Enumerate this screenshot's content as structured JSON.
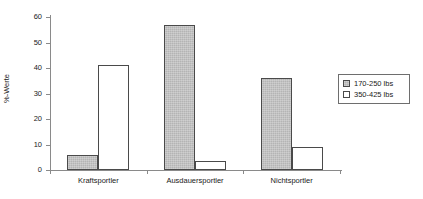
{
  "chart_data": {
    "type": "bar",
    "title": "",
    "xlabel": "",
    "ylabel": "%-Werte",
    "ylim": [
      0,
      60
    ],
    "yticks": [
      0,
      10,
      20,
      30,
      40,
      50,
      60
    ],
    "grid": false,
    "legend_position": "right",
    "categories": [
      "Kraftsportler",
      "Ausdauersportler",
      "Nichtsportler"
    ],
    "series": [
      {
        "name": "170-250 lbs",
        "values": [
          6,
          57,
          36
        ],
        "fill": "#b4b4b4",
        "stroke": "#4a4a4a"
      },
      {
        "name": "350-425 lbs",
        "values": [
          41,
          3.5,
          9
        ],
        "fill": "#ffffff",
        "stroke": "#4a4a4a"
      }
    ]
  },
  "axis": {
    "tick_labels": [
      "0",
      "10",
      "20",
      "30",
      "40",
      "50",
      "60"
    ],
    "y_title": "%-Werte"
  },
  "legend": {
    "items": [
      {
        "label": "170-250 lbs"
      },
      {
        "label": "350-425 lbs"
      }
    ]
  }
}
